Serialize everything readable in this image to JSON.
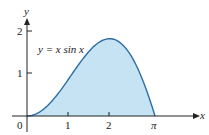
{
  "chart_data": {
    "type": "area",
    "title": "",
    "function_label": "y = x sin x",
    "xlabel": "x",
    "ylabel": "y",
    "x_ticks": [
      "0",
      "1",
      "2",
      "π"
    ],
    "y_ticks": [
      "1",
      "2"
    ],
    "xlim": [
      0,
      3.1416
    ],
    "ylim": [
      0,
      2
    ],
    "x": [
      0,
      0.5,
      1,
      1.5,
      2,
      2.5,
      2.8,
      3.1416
    ],
    "values": [
      0,
      0.24,
      0.84,
      1.5,
      1.82,
      1.5,
      0.94,
      0
    ],
    "fill_color": "#c5e3f2",
    "line_color": "#2e6da4",
    "grid": false,
    "legend": "none"
  }
}
